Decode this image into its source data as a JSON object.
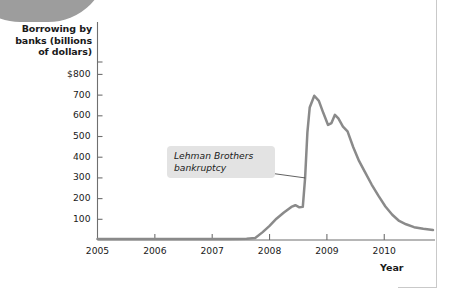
{
  "figure": {
    "axis_title_y": "Borrowing by banks (billions of dollars)",
    "axis_title_x": "Year",
    "annotation": "Lehman Brothers bankruptcy"
  },
  "colors": {
    "line": "#8a8a8a",
    "axis": "#6f6f6f",
    "callout_bg": "#e3e3e3",
    "text": "#1a1a1a",
    "blob": "#9d9d9d",
    "rule": "#c9c9c9"
  },
  "chart_data": {
    "type": "line",
    "title": "",
    "xlabel": "Year",
    "ylabel": "Borrowing by banks (billions of dollars)",
    "xlim": [
      2005.0,
      2010.85
    ],
    "ylim": [
      0,
      860
    ],
    "grid": false,
    "legend": null,
    "ytick_labels": [
      "$800",
      "700",
      "600",
      "500",
      "400",
      "300",
      "200",
      "100"
    ],
    "ytick_values": [
      800,
      700,
      600,
      500,
      400,
      300,
      200,
      100
    ],
    "xtick_labels": [
      "2005",
      "2006",
      "2007",
      "2008",
      "2009",
      "2010"
    ],
    "xtick_values": [
      2005,
      2006,
      2007,
      2008,
      2009,
      2010
    ],
    "annotations": [
      {
        "text": "Lehman Brothers bankruptcy",
        "points_to_x": 2008.62,
        "points_to_y": 300
      }
    ],
    "series": [
      {
        "name": "Borrowing by banks",
        "x": [
          2005.0,
          2005.5,
          2006.0,
          2006.5,
          2007.0,
          2007.3,
          2007.6,
          2007.75,
          2007.88,
          2008.0,
          2008.12,
          2008.25,
          2008.38,
          2008.45,
          2008.52,
          2008.58,
          2008.62,
          2008.66,
          2008.7,
          2008.78,
          2008.86,
          2008.94,
          2009.02,
          2009.08,
          2009.14,
          2009.2,
          2009.28,
          2009.36,
          2009.46,
          2009.56,
          2009.66,
          2009.78,
          2009.9,
          2010.02,
          2010.14,
          2010.26,
          2010.38,
          2010.52,
          2010.68,
          2010.85
        ],
        "y": [
          5,
          5,
          5,
          5,
          5,
          5,
          6,
          10,
          38,
          68,
          103,
          133,
          160,
          168,
          158,
          160,
          300,
          520,
          640,
          697,
          672,
          612,
          556,
          565,
          605,
          588,
          548,
          525,
          448,
          382,
          330,
          268,
          213,
          162,
          122,
          92,
          76,
          62,
          54,
          48
        ]
      }
    ]
  }
}
